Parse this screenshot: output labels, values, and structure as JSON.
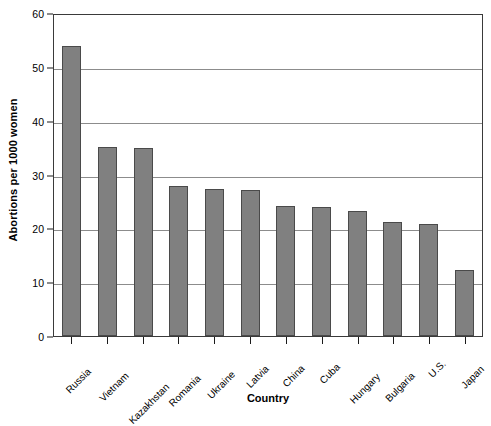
{
  "chart_data": {
    "type": "bar",
    "title": "",
    "xlabel": "Country",
    "ylabel": "Abortions per 1000 women",
    "categories": [
      "Russia",
      "Vietnam",
      "Kazakhstan",
      "Romania",
      "Ukraine",
      "Latvia",
      "China",
      "Cuba",
      "Hungary",
      "Bulgaria",
      "U.S.",
      "Japan"
    ],
    "values": [
      53.8,
      35.2,
      34.9,
      27.8,
      27.4,
      27.2,
      24.1,
      24.0,
      23.3,
      21.2,
      20.8,
      12.2
    ],
    "ylim": [
      0,
      60
    ],
    "yticks": [
      0,
      10,
      20,
      30,
      40,
      50,
      60
    ],
    "ytick_labels": [
      "0",
      "10",
      "20",
      "30",
      "40",
      "50",
      "60"
    ],
    "grid": "horizontal",
    "legend": "none",
    "bar_color": "#808080",
    "bar_border_color": "#4a4a4a",
    "gridline_color": "#8c8c8c",
    "axis_color": "#3a3a3a"
  }
}
